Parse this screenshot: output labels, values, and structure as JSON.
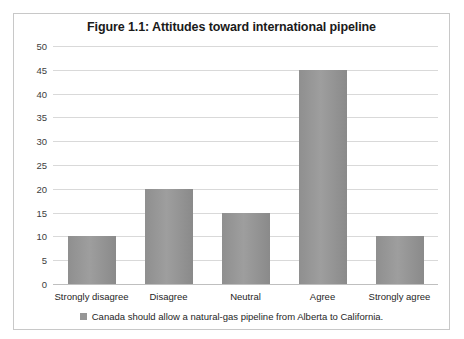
{
  "chart_data": {
    "type": "bar",
    "title": "Figure 1.1: Attitudes toward international pipeline",
    "categories": [
      "Strongly disagree",
      "Disagree",
      "Neutral",
      "Agree",
      "Strongly agree"
    ],
    "values": [
      10,
      20,
      15,
      45,
      10
    ],
    "series": [
      {
        "name": "Canada should allow a natural-gas pipeline from Alberta to California.",
        "values": [
          10,
          20,
          15,
          45,
          10
        ]
      }
    ],
    "xlabel": "",
    "ylabel": "",
    "ylim": [
      0,
      50
    ],
    "ytick_step": 5,
    "yticks": [
      0,
      5,
      10,
      15,
      20,
      25,
      30,
      35,
      40,
      45,
      50
    ],
    "grid": true,
    "legend_position": "bottom",
    "bar_color": "#969696",
    "gridline_color": "#d9d9d9",
    "frame_color": "#c8c8c8",
    "background": "#ffffff"
  },
  "legend": {
    "label": "Canada should allow a natural-gas pipeline from Alberta to California."
  }
}
